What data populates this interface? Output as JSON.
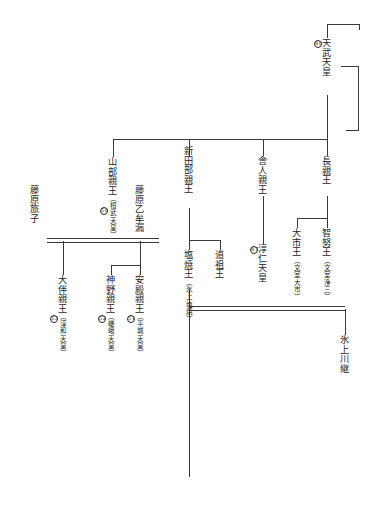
{
  "figure": {
    "reading_direction": "vertical-right-to-left",
    "background": "#ffffff",
    "line_color": "#3a3a3a"
  },
  "nodes": {
    "temmu": {
      "name": "天武天皇",
      "alias": "",
      "ordinal": "40"
    },
    "naga": {
      "name": "長親王",
      "alias": "",
      "ordinal": ""
    },
    "chinu": {
      "name": "智努王",
      "alias": "（文室浄三）",
      "ordinal": ""
    },
    "ochi": {
      "name": "大市王",
      "alias": "（文室大市）",
      "ordinal": ""
    },
    "toneri": {
      "name": "舎人親王",
      "alias": "",
      "ordinal": ""
    },
    "junnin": {
      "name": "淳仁天皇",
      "alias": "",
      "ordinal": "47"
    },
    "niitabe": {
      "name": "新田部親王",
      "alias": "",
      "ordinal": ""
    },
    "funado": {
      "name": "道祖王",
      "alias": "",
      "ordinal": ""
    },
    "shioyaki": {
      "name": "塩焼王",
      "alias": "（氷上塩焼）",
      "ordinal": ""
    },
    "kawatsugu": {
      "name": "氷上川継",
      "alias": "",
      "ordinal": ""
    },
    "yamabe": {
      "name": "山部親王",
      "alias": "（桓武天皇）",
      "ordinal": "50"
    },
    "otomuro": {
      "name": "藤原乙牟漏",
      "alias": "",
      "ordinal": ""
    },
    "tabiko": {
      "name": "藤原旅子",
      "alias": "",
      "ordinal": ""
    },
    "otomo": {
      "name": "大伴親王",
      "alias": "（淳和天皇）",
      "ordinal": "53"
    },
    "kamino": {
      "name": "神野親王",
      "alias": "（嵯峨天皇）",
      "ordinal": "52"
    },
    "ate": {
      "name": "安殿親王",
      "alias": "（平城天皇）",
      "ordinal": "51"
    }
  },
  "relations": [
    {
      "from": "temmu",
      "to": "naga",
      "type": "descent"
    },
    {
      "from": "temmu",
      "to": "toneri",
      "type": "descent"
    },
    {
      "from": "temmu",
      "to": "niitabe",
      "type": "descent"
    },
    {
      "from": "temmu",
      "to": "yamabe",
      "type": "descent-branch"
    },
    {
      "from": "naga",
      "to": "chinu",
      "type": "descent"
    },
    {
      "from": "naga",
      "to": "ochi",
      "type": "descent"
    },
    {
      "from": "toneri",
      "to": "junnin",
      "type": "descent"
    },
    {
      "from": "niitabe",
      "to": "funado",
      "type": "descent"
    },
    {
      "from": "niitabe",
      "to": "shioyaki",
      "type": "descent"
    },
    {
      "from": "shioyaki",
      "to": "kawatsugu",
      "type": "descent"
    },
    {
      "from": "yamabe",
      "to": "otomuro",
      "type": "marriage"
    },
    {
      "from": "yamabe",
      "to": "tabiko",
      "type": "marriage"
    },
    {
      "from": "otomuro",
      "to": "ate",
      "type": "descent"
    },
    {
      "from": "otomuro",
      "to": "kamino",
      "type": "descent"
    },
    {
      "from": "tabiko",
      "to": "otomo",
      "type": "descent"
    }
  ]
}
